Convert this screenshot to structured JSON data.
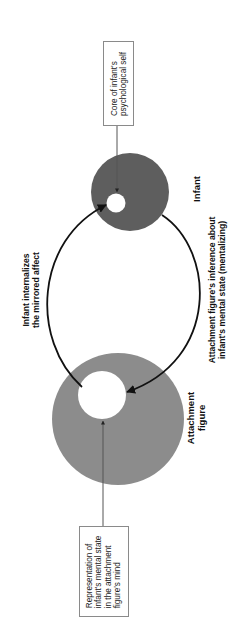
{
  "diagram": {
    "colors": {
      "infant_circle": "#5e5e5e",
      "attachment_circle": "#8c8c8c",
      "inner_circle": "#ffffff",
      "arrow": "#111111",
      "connector": "#777777",
      "box_border": "#8a8a8a"
    },
    "nodes": {
      "infant": {
        "label": "Infant"
      },
      "attachment": {
        "label_line1": "Attachment",
        "label_line2": "figure"
      }
    },
    "callouts": {
      "core_self": {
        "line1": "Core of infant's",
        "line2": "psychological self"
      },
      "representation": {
        "line1": "Representation of",
        "line2": "infant's mental state",
        "line3": "in the attachment",
        "line4": "figure's mind"
      }
    },
    "edges": {
      "internalizes": {
        "line1": "Infant internalizes",
        "line2": "the mirrored affect"
      },
      "mentalizing": {
        "line1": "Attachment figure's inference about",
        "line2": "infant's mental state (mentalizing)"
      }
    }
  }
}
